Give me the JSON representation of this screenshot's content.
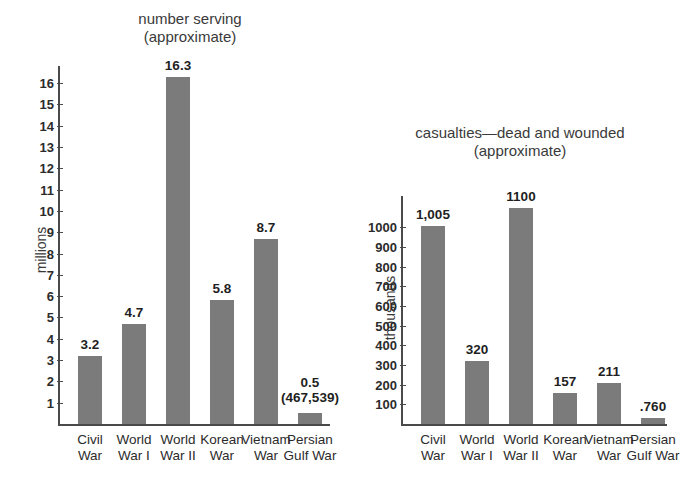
{
  "chart_data": [
    {
      "type": "bar",
      "id": "number-serving",
      "title": "number serving",
      "subtitle": "(approximate)",
      "xlabel": "",
      "ylabel": "millions",
      "ylim": [
        0,
        16.8
      ],
      "yticks": [
        1,
        2,
        3,
        4,
        5,
        6,
        7,
        8,
        9,
        10,
        11,
        12,
        13,
        14,
        15,
        16
      ],
      "grid": false,
      "legend": "none",
      "bar_color": "#7b7b7b",
      "categories": [
        "Civil War",
        "World War I",
        "World War II",
        "Korean War",
        "Vietnam War",
        "Persian Gulf War"
      ],
      "category_lines": [
        [
          "Civil",
          "War"
        ],
        [
          "World",
          "War I"
        ],
        [
          "World",
          "War II"
        ],
        [
          "Korean",
          "War"
        ],
        [
          "Vietnam",
          "War"
        ],
        [
          "Persian",
          "Gulf War"
        ]
      ],
      "values": [
        3.2,
        4.7,
        16.3,
        5.8,
        8.7,
        0.5
      ],
      "value_labels": [
        "3.2",
        "4.7",
        "16.3",
        "5.8",
        "8.7",
        "0.5"
      ],
      "value_sublabels": [
        "",
        "",
        "",
        "",
        "",
        "(467,539)"
      ]
    },
    {
      "type": "bar",
      "id": "casualties",
      "title": "casualties—dead and wounded",
      "subtitle": "(approximate)",
      "xlabel": "",
      "ylabel": "thousands",
      "ylim": [
        0,
        1160
      ],
      "yticks": [
        100,
        200,
        300,
        400,
        500,
        600,
        700,
        800,
        900,
        1000
      ],
      "grid": false,
      "legend": "none",
      "bar_color": "#7b7b7b",
      "categories": [
        "Civil War",
        "World War I",
        "World War II",
        "Korean War",
        "Vietnam War",
        "Persian Gulf War"
      ],
      "category_lines": [
        [
          "Civil",
          "War"
        ],
        [
          "World",
          "War I"
        ],
        [
          "World",
          "War II"
        ],
        [
          "Korean",
          "War"
        ],
        [
          "Vietnam",
          "War"
        ],
        [
          "Persian",
          "Gulf War"
        ]
      ],
      "values": [
        1005,
        320,
        1100,
        157,
        211,
        0.76
      ],
      "value_labels": [
        "1,005",
        "320",
        "1100",
        "157",
        "211",
        ".760"
      ],
      "value_sublabels": [
        "",
        "",
        "",
        "",
        "",
        ""
      ]
    }
  ]
}
